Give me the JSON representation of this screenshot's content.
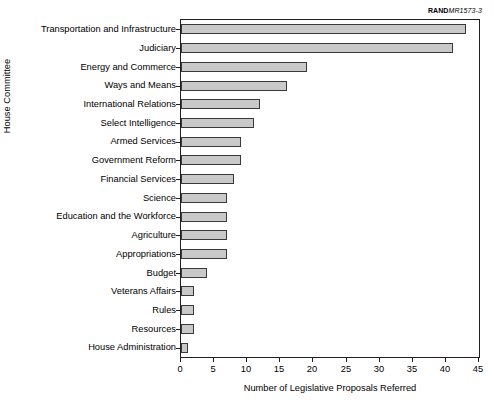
{
  "figure": {
    "source_tag_brand": "RAND",
    "source_tag_number": "MR1573-3"
  },
  "chart_data": {
    "type": "bar",
    "orientation": "horizontal",
    "title": "",
    "xlabel": "Number of Legislative Proposals Referred",
    "ylabel": "House Committee",
    "xlim": [
      0,
      45
    ],
    "xticks": [
      0,
      5,
      10,
      15,
      20,
      25,
      30,
      35,
      40,
      45
    ],
    "xtick_labels": [
      "0",
      "5",
      "10",
      "15",
      "20",
      "25",
      "30",
      "35",
      "40",
      "45"
    ],
    "grid": false,
    "legend": null,
    "bar_fill_color": "#c9c9c9",
    "bar_edge_color": "#3a3a3a",
    "categories": [
      "Transportation and Infrastructure",
      "Judiciary",
      "Energy and Commerce",
      "Ways and Means",
      "International Relations",
      "Select Intelligence",
      "Armed Services",
      "Government Reform",
      "Financial Services",
      "Science",
      "Education and the Workforce",
      "Agriculture",
      "Appropriations",
      "Budget",
      "Veterans Affairs",
      "Rules",
      "Resources",
      "House Administration"
    ],
    "values": [
      43,
      41,
      19,
      16,
      12,
      11,
      9,
      9,
      8,
      7,
      7,
      7,
      7,
      4,
      2,
      2,
      2,
      1
    ]
  }
}
